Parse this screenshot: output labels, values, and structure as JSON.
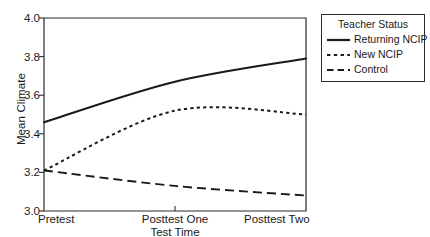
{
  "chart_data": {
    "type": "line",
    "title": "",
    "xlabel": "Test Time",
    "ylabel": "Mean Climate",
    "categories": [
      "Pretest",
      "Posttest One",
      "Posttest Two"
    ],
    "ylim": [
      3.0,
      4.0
    ],
    "yticks": [
      "3.0",
      "3.2",
      "3.4",
      "3.6",
      "3.8",
      "4.0"
    ],
    "ytick_values": [
      3.0,
      3.2,
      3.4,
      3.6,
      3.8,
      4.0
    ],
    "grid": false,
    "legend_position": "right-outside",
    "legend_title": "Teacher Status",
    "series": [
      {
        "name": "Returning NCIP",
        "style": "solid",
        "values": [
          3.46,
          3.67,
          3.79
        ]
      },
      {
        "name": "New NCIP",
        "style": "dotted",
        "values": [
          3.21,
          3.52,
          3.5
        ]
      },
      {
        "name": "Control",
        "style": "dashed",
        "values": [
          3.21,
          3.13,
          3.08
        ]
      }
    ],
    "colors": {
      "axis": "#2b2b2b",
      "series_line": "#1a1a1a",
      "background": "#ffffff"
    }
  }
}
